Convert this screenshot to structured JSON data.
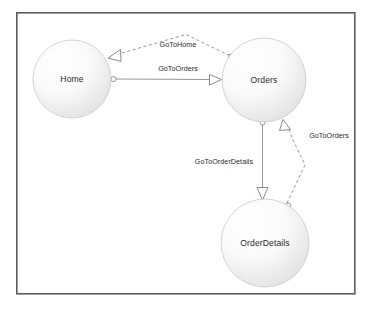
{
  "diagram": {
    "type": "state-machine-diagram",
    "frame": {
      "x": 16,
      "y": 12,
      "width": 339,
      "height": 282
    },
    "colors": {
      "frame_border": "#5c5c60",
      "node_fill_light": "#fdfdfd",
      "node_fill_dark": "#e2e2e2",
      "node_stroke": "#c9c9c9",
      "edge_stroke": "#8a8a8a",
      "text": "#2a2a2a",
      "background": "#ffffff"
    },
    "nodes": [
      {
        "id": "home",
        "label": "Home",
        "cx": 72,
        "cy": 79,
        "r": 39
      },
      {
        "id": "orders",
        "label": "Orders",
        "cx": 264,
        "cy": 80,
        "r": 42
      },
      {
        "id": "orderdetails",
        "label": "OrderDetails",
        "cx": 265,
        "cy": 243,
        "r": 44
      }
    ],
    "edges": [
      {
        "id": "orders-to-home",
        "label": "GoToHome",
        "from": "orders",
        "to": "home",
        "style": "dashed",
        "label_x": 178,
        "label_y": 47,
        "source_marker": "circle",
        "target_marker": "hollow-triangle"
      },
      {
        "id": "home-to-orders",
        "label": "GoToOrders",
        "from": "home",
        "to": "orders",
        "style": "solid",
        "label_x": 178,
        "label_y": 71,
        "source_marker": "circle",
        "target_marker": "hollow-triangle"
      },
      {
        "id": "orders-to-orderdetails",
        "label": "GoToOrderDetails",
        "from": "orders",
        "to": "orderdetails",
        "style": "solid",
        "label_x": 224,
        "label_y": 164,
        "source_marker": "circle",
        "target_marker": "hollow-triangle"
      },
      {
        "id": "orderdetails-to-orders",
        "label": "GoToOrders",
        "from": "orderdetails",
        "to": "orders",
        "style": "dashed",
        "label_x": 329,
        "label_y": 138,
        "source_marker": "circle",
        "target_marker": "hollow-triangle"
      }
    ]
  }
}
